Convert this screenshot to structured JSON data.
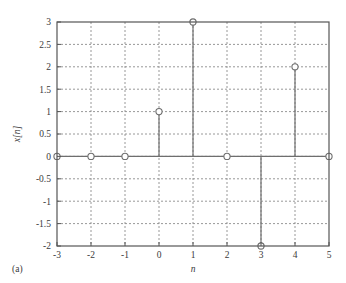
{
  "figure": {
    "panel_label": "(a)",
    "background_color": "#ffffff"
  },
  "chart_data": {
    "type": "line",
    "plot_style": "stem",
    "title": "",
    "subtitle": "",
    "xlabel": "n",
    "ylabel": "x[n]",
    "x": [
      -3,
      -2,
      -1,
      0,
      1,
      2,
      3,
      4,
      5
    ],
    "values": [
      0,
      0,
      0,
      1,
      3,
      0,
      -2,
      2,
      0
    ],
    "xlim": [
      -3,
      5
    ],
    "ylim": [
      -2,
      3
    ],
    "xticks": [
      -3,
      -2,
      -1,
      0,
      1,
      2,
      3,
      4,
      5
    ],
    "xticklabels": [
      "-3",
      "-2",
      "-1",
      "0",
      "1",
      "2",
      "3",
      "4",
      "5"
    ],
    "yticks": [
      -2,
      -1.5,
      -1,
      -0.5,
      0,
      0.5,
      1,
      1.5,
      2,
      2.5,
      3
    ],
    "yticklabels": [
      "-2",
      "-1.5",
      "-1",
      "-0.5",
      "0",
      "0.5",
      "1",
      "1.5",
      "2",
      "2.5",
      "3"
    ],
    "grid": true,
    "grid_style": "dotted",
    "grid_color": "#8c8c8c",
    "legend": null,
    "legend_position": "none",
    "marker": "open-circle",
    "marker_color": "#6e6e6e",
    "line_color": "#6e6e6e",
    "axis_color": "#555555",
    "annotations": []
  }
}
